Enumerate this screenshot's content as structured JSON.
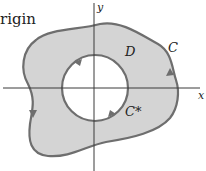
{
  "figure": {
    "partial_text": "rigin",
    "axes": {
      "x_label": "x",
      "y_label": "y"
    },
    "labels": {
      "region": "D",
      "outer_curve": "C",
      "inner_curve": "C*"
    },
    "colors": {
      "region_fill": "#d4d4d4",
      "curve_stroke": "#6e6e6e",
      "axis_stroke": "#3a3a3a",
      "hole_fill": "#ffffff"
    },
    "arrows": {
      "outer_curve": "counterclockwise",
      "inner_curve": "clockwise"
    }
  }
}
